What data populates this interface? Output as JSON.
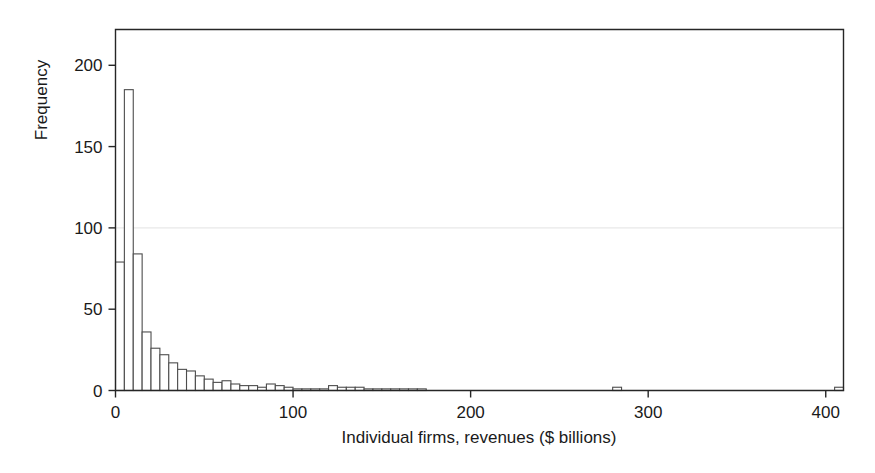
{
  "figure": {
    "background": "#ffffff",
    "frame_color": "#262626",
    "bar_edge_color": "#4d4d4d",
    "bar_fill_color": "#ffffff",
    "gridline_color": "#e8e8e8"
  },
  "axes": {
    "x_title": "Individual firms, revenues ($ billions)",
    "y_title": "Frequency",
    "x_ticks": [
      "0",
      "100",
      "200",
      "300",
      "400"
    ],
    "y_ticks": [
      "0",
      "50",
      "100",
      "150",
      "200"
    ]
  },
  "chart_data": {
    "type": "bar",
    "title": "",
    "subtitle": "",
    "xlabel": "Individual firms, revenues ($ billions)",
    "ylabel": "Frequency",
    "xlim": [
      0,
      410
    ],
    "ylim": [
      0,
      222
    ],
    "x_tick_values": [
      0,
      100,
      200,
      300,
      400
    ],
    "y_tick_values": [
      0,
      50,
      100,
      150,
      200
    ],
    "grid": "single faint horizontal rule at y=100",
    "legend": null,
    "bin_width": 5,
    "bin_starts": [
      0,
      5,
      10,
      15,
      20,
      25,
      30,
      35,
      40,
      45,
      50,
      55,
      60,
      65,
      70,
      75,
      80,
      85,
      90,
      95,
      100,
      105,
      110,
      115,
      120,
      125,
      130,
      135,
      140,
      145,
      150,
      155,
      160,
      165,
      170,
      175,
      180,
      185,
      190,
      195,
      200,
      205,
      210,
      215,
      220,
      225,
      230,
      235,
      240,
      245,
      250,
      255,
      260,
      265,
      270,
      275,
      280,
      285,
      290,
      295,
      300,
      305,
      310,
      315,
      320,
      325,
      330,
      335,
      340,
      345,
      350,
      355,
      360,
      365,
      370,
      375,
      380,
      385,
      390,
      395,
      400,
      405
    ],
    "categories": [
      "0",
      "5",
      "10",
      "15",
      "20",
      "25",
      "30",
      "35",
      "40",
      "45",
      "50",
      "55",
      "60",
      "65",
      "70",
      "75",
      "80",
      "85",
      "90",
      "95",
      "100",
      "105",
      "110",
      "115",
      "120",
      "125",
      "130",
      "135",
      "140",
      "145",
      "150",
      "155",
      "160",
      "165",
      "170",
      "175",
      "180",
      "185",
      "190",
      "195",
      "200",
      "205",
      "210",
      "215",
      "220",
      "225",
      "230",
      "235",
      "240",
      "245",
      "250",
      "255",
      "260",
      "265",
      "270",
      "275",
      "280",
      "285",
      "290",
      "295",
      "300",
      "305",
      "310",
      "315",
      "320",
      "325",
      "330",
      "335",
      "340",
      "345",
      "350",
      "355",
      "360",
      "365",
      "370",
      "375",
      "380",
      "385",
      "390",
      "395",
      "400",
      "405"
    ],
    "values": [
      79,
      185,
      84,
      36,
      26,
      22,
      17,
      13,
      12,
      9,
      7,
      5,
      6,
      4,
      3,
      3,
      2,
      4,
      3,
      2,
      1,
      1,
      1,
      1,
      3,
      2,
      2,
      2,
      1,
      1,
      1,
      1,
      1,
      1,
      1,
      0,
      0,
      0,
      0,
      0,
      0,
      0,
      0,
      0,
      0,
      0,
      0,
      0,
      0,
      0,
      0,
      0,
      0,
      0,
      0,
      0,
      2,
      0,
      0,
      0,
      0,
      0,
      0,
      0,
      0,
      0,
      0,
      0,
      0,
      0,
      0,
      0,
      0,
      0,
      0,
      0,
      0,
      0,
      0,
      0,
      0,
      2
    ],
    "max_value": 185
  }
}
